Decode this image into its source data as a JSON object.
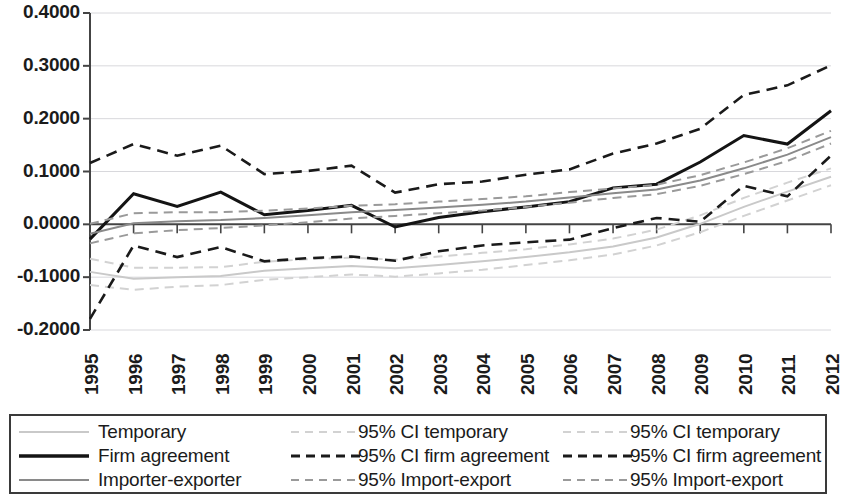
{
  "chart_data": {
    "type": "line",
    "title": "",
    "subtitle": "",
    "xlabel": "",
    "ylabel": "",
    "grid": true,
    "legend_position": "bottom",
    "xlim": [
      1995,
      2012
    ],
    "ylim": [
      -0.2,
      0.4
    ],
    "ytick_labels": [
      "0.4000",
      "0.3000",
      "0.2000",
      "0.1000",
      "0.0000",
      "-0.1000",
      "-0.2000"
    ],
    "ytick_values": [
      0.4,
      0.3,
      0.2,
      0.1,
      0.0,
      -0.1,
      -0.2
    ],
    "categories": [
      "1995",
      "1996",
      "1997",
      "1998",
      "1999",
      "2000",
      "2001",
      "2002",
      "2003",
      "2004",
      "2005",
      "2006",
      "2007",
      "2008",
      "2009",
      "2010",
      "2011",
      "2012"
    ],
    "x": [
      1995,
      1996,
      1997,
      1998,
      1999,
      2000,
      2001,
      2002,
      2003,
      2004,
      2005,
      2006,
      2007,
      2008,
      2009,
      2010,
      2011,
      2012
    ],
    "series": [
      {
        "name": "Temporary",
        "style": "solid",
        "color": "#c9c9c9",
        "width": 2.0,
        "values": [
          -0.09,
          -0.103,
          -0.1,
          -0.098,
          -0.088,
          -0.083,
          -0.079,
          -0.083,
          -0.077,
          -0.07,
          -0.062,
          -0.053,
          -0.042,
          -0.025,
          0.001,
          0.033,
          0.062,
          0.09
        ]
      },
      {
        "name": "95% CI temporary",
        "style": "dashed",
        "color": "#d2d2d2",
        "width": 2.0,
        "bound": "lower",
        "values": [
          -0.115,
          -0.124,
          -0.118,
          -0.115,
          -0.105,
          -0.1,
          -0.095,
          -0.099,
          -0.093,
          -0.086,
          -0.077,
          -0.068,
          -0.057,
          -0.04,
          -0.015,
          0.016,
          0.045,
          0.074
        ]
      },
      {
        "name": "95% CI temporary",
        "style": "dashed",
        "color": "#d2d2d2",
        "width": 2.0,
        "bound": "upper",
        "values": [
          -0.065,
          -0.082,
          -0.082,
          -0.081,
          -0.071,
          -0.066,
          -0.063,
          -0.067,
          -0.061,
          -0.054,
          -0.047,
          -0.038,
          -0.027,
          -0.01,
          0.017,
          0.05,
          0.079,
          0.106
        ]
      },
      {
        "name": "Firm agreement",
        "style": "solid",
        "color": "#141414",
        "width": 3.0,
        "values": [
          -0.028,
          0.058,
          0.034,
          0.061,
          0.018,
          0.026,
          0.036,
          -0.005,
          0.013,
          0.024,
          0.033,
          0.043,
          0.069,
          0.076,
          0.118,
          0.168,
          0.152,
          0.215
        ]
      },
      {
        "name": "95% CI firm agreement",
        "style": "dashed",
        "color": "#1a1a1a",
        "width": 2.6,
        "bound": "lower",
        "values": [
          -0.179,
          -0.04,
          -0.062,
          -0.043,
          -0.07,
          -0.064,
          -0.061,
          -0.069,
          -0.051,
          -0.04,
          -0.034,
          -0.029,
          -0.007,
          0.012,
          0.005,
          0.073,
          0.053,
          0.13
        ]
      },
      {
        "name": "95% CI firm agreement",
        "style": "dashed",
        "color": "#1a1a1a",
        "width": 2.6,
        "bound": "upper",
        "values": [
          0.116,
          0.152,
          0.13,
          0.149,
          0.095,
          0.101,
          0.111,
          0.06,
          0.076,
          0.081,
          0.094,
          0.104,
          0.134,
          0.153,
          0.181,
          0.245,
          0.263,
          0.301
        ]
      },
      {
        "name": "Importer-exporter",
        "style": "solid",
        "color": "#8a8a8a",
        "width": 2.0,
        "values": [
          -0.018,
          0.002,
          0.006,
          0.008,
          0.012,
          0.017,
          0.023,
          0.027,
          0.032,
          0.037,
          0.043,
          0.051,
          0.059,
          0.066,
          0.083,
          0.106,
          0.132,
          0.165
        ]
      },
      {
        "name": "95% Import-export",
        "style": "dashed",
        "color": "#9a9a9a",
        "width": 2.0,
        "bound": "lower",
        "values": [
          -0.036,
          -0.017,
          -0.011,
          -0.007,
          -0.002,
          0.004,
          0.011,
          0.016,
          0.021,
          0.026,
          0.033,
          0.041,
          0.05,
          0.057,
          0.073,
          0.095,
          0.12,
          0.153
        ]
      },
      {
        "name": "95% Import-export",
        "style": "dashed",
        "color": "#9a9a9a",
        "width": 2.0,
        "bound": "upper",
        "values": [
          0.001,
          0.021,
          0.023,
          0.023,
          0.026,
          0.03,
          0.035,
          0.038,
          0.043,
          0.048,
          0.053,
          0.061,
          0.068,
          0.075,
          0.093,
          0.117,
          0.144,
          0.177
        ]
      }
    ]
  },
  "legend": {
    "items": [
      {
        "label": "Temporary",
        "style": "solid",
        "color": "#c9c9c9",
        "width": 2.2
      },
      {
        "label": "95% CI temporary",
        "style": "dashed",
        "color": "#d2d2d2",
        "width": 2.2
      },
      {
        "label": "95% CI temporary",
        "style": "dashed",
        "color": "#d2d2d2",
        "width": 2.2
      },
      {
        "label": "Firm agreement",
        "style": "solid",
        "color": "#141414",
        "width": 3.4
      },
      {
        "label": "95% CI firm agreement",
        "style": "dashed",
        "color": "#1a1a1a",
        "width": 2.8
      },
      {
        "label": "95% CI firm agreement",
        "style": "dashed",
        "color": "#1a1a1a",
        "width": 2.8
      },
      {
        "label": "Importer-exporter",
        "style": "solid",
        "color": "#8a8a8a",
        "width": 2.0
      },
      {
        "label": "95% Import-export",
        "style": "dashed",
        "color": "#9a9a9a",
        "width": 2.2
      },
      {
        "label": "95% Import-export",
        "style": "dashed",
        "color": "#9a9a9a",
        "width": 2.2
      }
    ]
  },
  "axes": {
    "axis_color": "#444444",
    "grid_color": "#d8d8dc",
    "zero_line_color": "#444444"
  }
}
